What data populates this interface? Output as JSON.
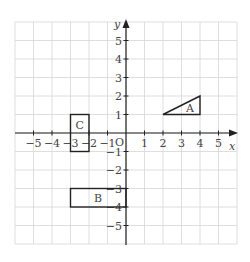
{
  "diagram": {
    "type": "coordinate-grid",
    "axes": {
      "x_label": "x",
      "y_label": "y",
      "origin_label": "O",
      "x_ticks": [
        "−5",
        "−4",
        "−3",
        "−2",
        "−1",
        "1",
        "2",
        "3",
        "4",
        "5"
      ],
      "y_ticks": [
        "5",
        "4",
        "3",
        "2",
        "1",
        "−1",
        "−2",
        "−3",
        "−4",
        "−5"
      ],
      "range": {
        "x": [
          -6,
          6
        ],
        "y": [
          -6,
          6
        ]
      }
    },
    "shapes": [
      {
        "label": "A",
        "kind": "triangle",
        "vertices": [
          [
            2,
            1
          ],
          [
            4,
            1
          ],
          [
            4,
            2
          ]
        ]
      },
      {
        "label": "B",
        "kind": "rectangle",
        "vertices": [
          [
            -3,
            -3
          ],
          [
            0,
            -3
          ],
          [
            0,
            -4
          ],
          [
            -3,
            -4
          ]
        ]
      },
      {
        "label": "C",
        "kind": "rectangle",
        "vertices": [
          [
            -3,
            1
          ],
          [
            -2,
            1
          ],
          [
            -2,
            -1
          ],
          [
            -3,
            -1
          ]
        ]
      }
    ],
    "colors": {
      "grid": "#d6d6d6",
      "axis": "#222222",
      "shape": "#222222"
    }
  }
}
